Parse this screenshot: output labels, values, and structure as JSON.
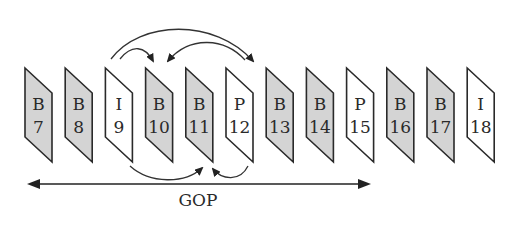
{
  "diagram": {
    "colors": {
      "b_frame_fill": "#d4d4d4",
      "ip_frame_fill": "#ffffff",
      "stroke": "#2a2a2a"
    },
    "frames": [
      {
        "type": "B",
        "number": "7",
        "shaded": true
      },
      {
        "type": "B",
        "number": "8",
        "shaded": true
      },
      {
        "type": "I",
        "number": "9",
        "shaded": false
      },
      {
        "type": "B",
        "number": "10",
        "shaded": true
      },
      {
        "type": "B",
        "number": "11",
        "shaded": true
      },
      {
        "type": "P",
        "number": "12",
        "shaded": false
      },
      {
        "type": "B",
        "number": "13",
        "shaded": true
      },
      {
        "type": "B",
        "number": "14",
        "shaded": true
      },
      {
        "type": "P",
        "number": "15",
        "shaded": false
      },
      {
        "type": "B",
        "number": "16",
        "shaded": true
      },
      {
        "type": "B",
        "number": "17",
        "shaded": true
      },
      {
        "type": "I",
        "number": "18",
        "shaded": false
      }
    ],
    "references": [
      {
        "from": "I9",
        "to": "B10",
        "side": "top"
      },
      {
        "from": "I9",
        "to": "P12",
        "side": "top"
      },
      {
        "from": "P12",
        "to": "B10",
        "side": "top"
      },
      {
        "from": "I9",
        "to": "B11",
        "side": "bottom"
      },
      {
        "from": "P12",
        "to": "B11",
        "side": "bottom"
      }
    ],
    "gop": {
      "label": "GOP",
      "span": "B7 to P15 boundary",
      "bidirectional": true
    }
  }
}
